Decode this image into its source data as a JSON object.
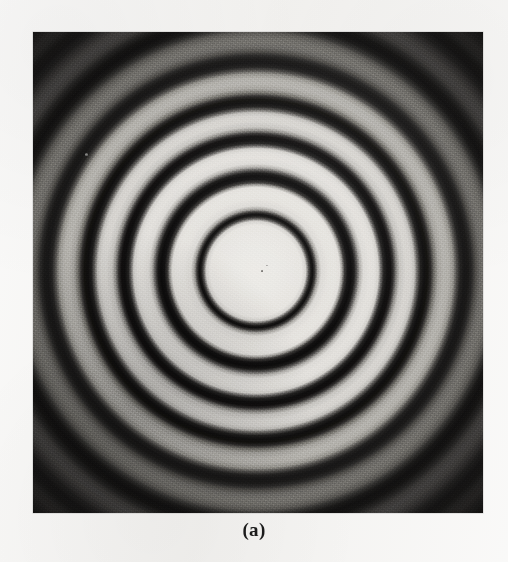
{
  "figure": {
    "caption": "(a)",
    "panel_label": "(a)",
    "kind": "photograph",
    "background_color": "#f4f3f1",
    "plate_color": "#050505",
    "fringe_bright_color": "#eeece8",
    "fringe_dark_color": "#0c0b0b",
    "plate": {
      "left": 33,
      "top": 32,
      "width": 450,
      "height": 481
    },
    "pattern": {
      "center_x": 230,
      "center_y": 240,
      "ring_count_visible": 7,
      "central_disc_radius": 52
    }
  },
  "chart_data": {
    "type": "line",
    "title": "",
    "subtitle": "",
    "xlabel": "",
    "ylabel": "",
    "legend": [],
    "grid": false,
    "xlim": [
      0,
      230
    ],
    "ylim": [
      0,
      1
    ],
    "x": [
      0,
      10,
      20,
      30,
      40,
      48,
      52,
      55,
      58,
      62,
      70,
      80,
      86,
      90,
      95,
      100,
      106,
      112,
      118,
      124,
      130,
      140,
      150,
      158,
      166,
      174,
      182,
      190,
      198,
      206,
      214,
      222,
      230
    ],
    "series": [
      {
        "name": "radial intensity",
        "values": [
          0.93,
          0.93,
          0.92,
          0.91,
          0.9,
          0.84,
          0.29,
          0.05,
          0.06,
          0.23,
          0.87,
          0.9,
          0.62,
          0.23,
          0.05,
          0.07,
          0.34,
          0.84,
          0.86,
          0.76,
          0.14,
          0.06,
          0.19,
          0.7,
          0.83,
          0.72,
          0.18,
          0.06,
          0.15,
          0.55,
          0.64,
          0.42,
          0.12
        ]
      }
    ],
    "annotations": [
      {
        "label": "central bright disc",
        "r": 0
      },
      {
        "label": "1st dark fringe",
        "r": 55
      },
      {
        "label": "2nd dark fringe",
        "r": 87
      },
      {
        "label": "3rd dark fringe",
        "r": 118
      },
      {
        "label": "4th dark fringe",
        "r": 152
      },
      {
        "label": "5th dark fringe",
        "r": 190
      }
    ]
  }
}
